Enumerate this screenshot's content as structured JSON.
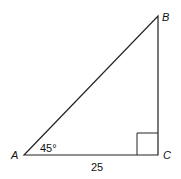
{
  "diagram": {
    "type": "right-triangle",
    "vertices": {
      "A": {
        "label": "A",
        "x": 24,
        "y": 155
      },
      "B": {
        "label": "B",
        "x": 158,
        "y": 16
      },
      "C": {
        "label": "C",
        "x": 158,
        "y": 155
      }
    },
    "angle_A": "45°",
    "side_AC": "25",
    "right_angle_at": "C",
    "stroke_color": "#222222"
  }
}
